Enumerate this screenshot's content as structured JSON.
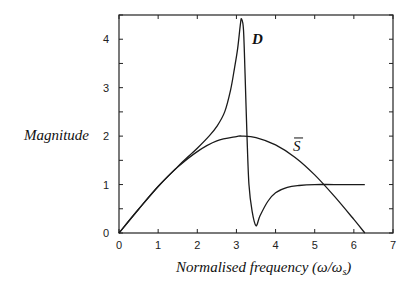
{
  "chart_data": {
    "type": "line",
    "title": "",
    "xlabel": "Normalised frequency (ω/ω_s)",
    "xlabel_main": "Normalised frequency ",
    "xlabel_math": "(ω/ω",
    "xlabel_sub": "s",
    "xlabel_close": ")",
    "ylabel": "Magnitude",
    "xlim": [
      0,
      7
    ],
    "ylim": [
      0,
      4.5
    ],
    "xticks": [
      "0",
      "1",
      "2",
      "3",
      "4",
      "5",
      "6",
      "7"
    ],
    "yticks": [
      "0",
      "1",
      "2",
      "3",
      "4"
    ],
    "grid": false,
    "legend": "inline labels",
    "series": [
      {
        "name": "D",
        "label": "D",
        "label_pos": [
          3.55,
          4.0
        ],
        "x": [
          0,
          0.5,
          1.0,
          1.5,
          1.8,
          2.0,
          2.3,
          2.5,
          2.7,
          2.85,
          2.95,
          3.03,
          3.1,
          3.13,
          3.18,
          3.22,
          3.27,
          3.32,
          3.4,
          3.5,
          3.6,
          3.8,
          4.0,
          4.3,
          4.6,
          5.0,
          5.5,
          6.28
        ],
        "values": [
          0,
          0.49,
          0.96,
          1.37,
          1.6,
          1.75,
          2.0,
          2.2,
          2.5,
          2.95,
          3.4,
          3.8,
          4.3,
          4.42,
          4.2,
          3.3,
          2.0,
          1.0,
          0.45,
          0.15,
          0.35,
          0.65,
          0.83,
          0.94,
          0.98,
          1.0,
          1.0,
          1.0
        ]
      },
      {
        "name": "S-bar",
        "label": "S",
        "label_overbar": true,
        "label_pos": [
          4.6,
          1.9
        ],
        "x": [
          0,
          0.5,
          1.0,
          1.5,
          2.0,
          2.5,
          3.0,
          3.14,
          3.5,
          4.0,
          4.5,
          5.0,
          5.5,
          6.0,
          6.28
        ],
        "values": [
          0,
          0.49,
          0.96,
          1.36,
          1.68,
          1.9,
          1.99,
          2.0,
          1.97,
          1.82,
          1.56,
          1.2,
          0.76,
          0.28,
          0
        ]
      }
    ]
  }
}
